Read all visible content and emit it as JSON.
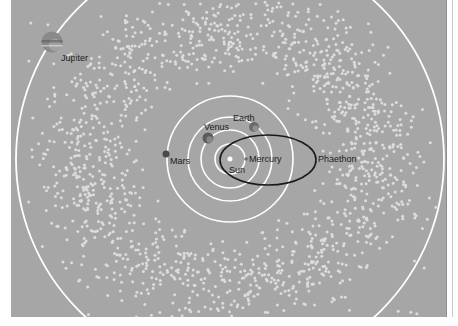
{
  "diagram": {
    "title": "",
    "background_color": "#a6a6a6",
    "dot_color": "#dcdcdc",
    "orbit_color": "#ffffff",
    "highlight_orbit_color": "#1a1a1a",
    "sun": {
      "label": "Sun",
      "x": 219,
      "y": 159,
      "r": 2.5,
      "color": "#ffffff"
    },
    "orbits": [
      {
        "name": "Mercury",
        "r": 15
      },
      {
        "name": "Venus",
        "r": 29
      },
      {
        "name": "Earth",
        "r": 42
      },
      {
        "name": "Mars",
        "r": 63
      },
      {
        "name": "Jupiter",
        "r": 214
      }
    ],
    "bodies": [
      {
        "name": "mercury",
        "label": "Mercury",
        "x": 235,
        "y": 159,
        "r": 1.8,
        "color": "#6e6e6e",
        "label_x": 238,
        "label_y": 162
      },
      {
        "name": "venus",
        "label": "Venus",
        "x": 197,
        "y": 138,
        "r": 5.5,
        "color": "#5a5a5a",
        "label_x": 193,
        "label_y": 130
      },
      {
        "name": "earth",
        "label": "Earth",
        "x": 243,
        "y": 127,
        "r": 5,
        "color": "#6a6a6a",
        "label_x": 222,
        "label_y": 121
      },
      {
        "name": "mars",
        "label": "Mars",
        "x": 155,
        "y": 154,
        "r": 3.5,
        "color": "#4a4a4a",
        "label_x": 159,
        "label_y": 164
      },
      {
        "name": "jupiter",
        "label": "Jupiter",
        "x": 41,
        "y": 42,
        "r": 10.5,
        "color": "#8a8a8a",
        "label_x": 50,
        "label_y": 61
      }
    ],
    "phaethon": {
      "label": "Phaethon",
      "cx": 257,
      "cy": 160,
      "rx": 48,
      "ry": 25,
      "label_x": 307,
      "label_y": 162
    },
    "sun_label_pos": {
      "x": 218,
      "y": 173
    },
    "dust_field": {
      "count": 1500,
      "inner_r": 78,
      "outer_r": 195,
      "dot_r": 1.5
    }
  }
}
